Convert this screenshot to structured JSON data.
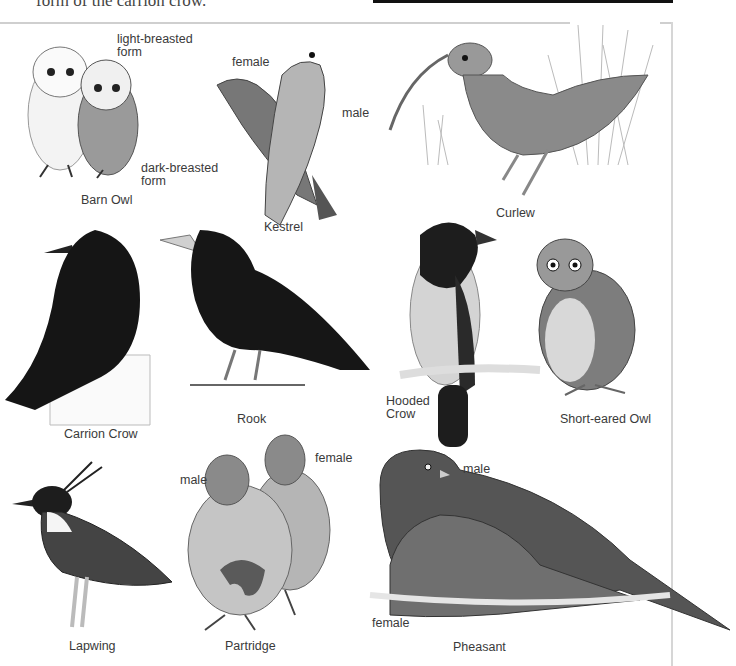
{
  "page": {
    "top_text": "form of the carrion crow.",
    "accent_colors": {
      "ink": "#111111",
      "frame": "#cfcfcf",
      "label": "#3a3a3a"
    }
  },
  "birds": [
    {
      "id": "barn-owl",
      "name": "Barn Owl",
      "notes": [
        "light-breasted\nform",
        "dark-breasted\nform"
      ]
    },
    {
      "id": "kestrel",
      "name": "Kestrel",
      "notes": [
        "female",
        "male"
      ]
    },
    {
      "id": "curlew",
      "name": "Curlew",
      "notes": []
    },
    {
      "id": "carrion-crow",
      "name": "Carrion Crow",
      "notes": []
    },
    {
      "id": "rook",
      "name": "Rook",
      "notes": []
    },
    {
      "id": "hooded-crow",
      "name": "Hooded\nCrow",
      "notes": []
    },
    {
      "id": "short-eared-owl",
      "name": "Short-eared Owl",
      "notes": []
    },
    {
      "id": "lapwing",
      "name": "Lapwing",
      "notes": []
    },
    {
      "id": "partridge",
      "name": "Partridge",
      "notes": [
        "male",
        "female"
      ]
    },
    {
      "id": "pheasant",
      "name": "Pheasant",
      "notes": [
        "male",
        "female"
      ]
    }
  ]
}
